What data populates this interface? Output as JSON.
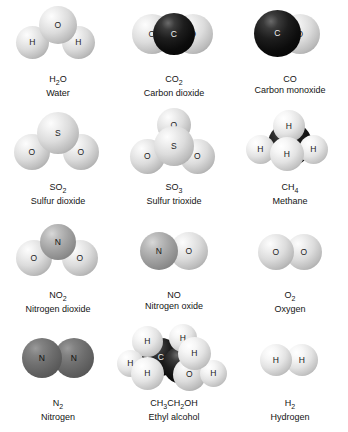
{
  "figure": {
    "kind": "molecular-model-grid",
    "columns": 3,
    "rows": 4,
    "palette": {
      "hydrogen": "#f2f2f2",
      "oxygen": "#dcdcdc",
      "sulfur": "#e0e0e0",
      "nitrogen": "#8b8b8b",
      "carbon": "#0c0c0c",
      "background": "#ffffff",
      "label_text": "#141414"
    }
  },
  "molecules": [
    {
      "id": "water",
      "formula_html": "H<sub>2</sub>O",
      "formula_plain": "H2O",
      "name": "Water",
      "atoms": [
        {
          "symbol": "O",
          "shade": "s-light",
          "size": 38,
          "x": 39,
          "y": 6,
          "z": 2
        },
        {
          "symbol": "H",
          "shade": "s-light",
          "size": 33,
          "x": 16,
          "y": 26,
          "z": 1
        },
        {
          "symbol": "H",
          "shade": "s-light",
          "size": 33,
          "x": 62,
          "y": 26,
          "z": 1
        }
      ]
    },
    {
      "id": "carbon-dioxide",
      "formula_html": "CO<sub>2</sub>",
      "formula_plain": "CO2",
      "name": "Carbon dioxide",
      "atoms": [
        {
          "symbol": "O",
          "shade": "s-light",
          "size": 40,
          "x": 16,
          "y": 14,
          "z": 1
        },
        {
          "symbol": "O",
          "shade": "s-light",
          "size": 40,
          "x": 57,
          "y": 14,
          "z": 1
        },
        {
          "symbol": "C",
          "shade": "s-black",
          "size": 42,
          "x": 37,
          "y": 13,
          "z": 3
        }
      ]
    },
    {
      "id": "carbon-monoxide",
      "formula_html": "CO",
      "formula_plain": "CO",
      "name": "Carbon monoxide",
      "atoms": [
        {
          "symbol": "O",
          "shade": "s-light",
          "size": 40,
          "x": 48,
          "y": 14,
          "z": 1
        },
        {
          "symbol": "C",
          "shade": "s-black",
          "size": 47,
          "x": 22,
          "y": 10,
          "z": 3
        }
      ]
    },
    {
      "id": "sulfur-dioxide",
      "formula_html": "SO<sub>2</sub>",
      "formula_plain": "SO2",
      "name": "Sulfur dioxide",
      "atoms": [
        {
          "symbol": "S",
          "shade": "s-light",
          "size": 42,
          "x": 37,
          "y": 4,
          "z": 2
        },
        {
          "symbol": "O",
          "shade": "s-light",
          "size": 36,
          "x": 14,
          "y": 26,
          "z": 1
        },
        {
          "symbol": "O",
          "shade": "s-light",
          "size": 36,
          "x": 63,
          "y": 26,
          "z": 1
        }
      ]
    },
    {
      "id": "sulfur-trioxide",
      "formula_html": "SO<sub>3</sub>",
      "formula_plain": "SO3",
      "name": "Sulfur trioxide",
      "atoms": [
        {
          "symbol": "O",
          "shade": "s-light",
          "size": 34,
          "x": 41,
          "y": 0,
          "z": 1
        },
        {
          "symbol": "S",
          "shade": "s-light",
          "size": 40,
          "x": 38,
          "y": 18,
          "z": 3
        },
        {
          "symbol": "O",
          "shade": "s-light",
          "size": 35,
          "x": 14,
          "y": 31,
          "z": 2
        },
        {
          "symbol": "O",
          "shade": "s-light",
          "size": 35,
          "x": 64,
          "y": 31,
          "z": 2
        }
      ]
    },
    {
      "id": "methane",
      "formula_html": "CH<sub>4</sub>",
      "formula_plain": "CH4",
      "name": "Methane",
      "atoms": [
        {
          "symbol": "C",
          "shade": "s-black",
          "size": 44,
          "x": 36,
          "y": 14,
          "z": 1
        },
        {
          "symbol": "H",
          "shade": "s-white",
          "size": 32,
          "x": 41,
          "y": 2,
          "z": 2
        },
        {
          "symbol": "H",
          "shade": "s-white",
          "size": 29,
          "x": 14,
          "y": 27,
          "z": 2
        },
        {
          "symbol": "H",
          "shade": "s-white",
          "size": 29,
          "x": 67,
          "y": 27,
          "z": 2
        },
        {
          "symbol": "H",
          "shade": "s-white",
          "size": 34,
          "x": 38,
          "y": 29,
          "z": 3
        }
      ]
    },
    {
      "id": "nitrogen-dioxide",
      "formula_html": "NO<sub>2</sub>",
      "formula_plain": "NO2",
      "name": "Nitrogen dioxide",
      "atoms": [
        {
          "symbol": "N",
          "shade": "s-mid",
          "size": 36,
          "x": 40,
          "y": 8,
          "z": 2
        },
        {
          "symbol": "O",
          "shade": "s-light",
          "size": 36,
          "x": 16,
          "y": 24,
          "z": 1
        },
        {
          "symbol": "O",
          "shade": "s-light",
          "size": 36,
          "x": 62,
          "y": 24,
          "z": 1
        }
      ]
    },
    {
      "id": "nitrogen-oxide",
      "formula_html": "NO",
      "formula_plain": "NO",
      "name": "Nitrogen oxide",
      "atoms": [
        {
          "symbol": "N",
          "shade": "s-mid",
          "size": 38,
          "x": 24,
          "y": 16,
          "z": 2
        },
        {
          "symbol": "O",
          "shade": "s-light",
          "size": 38,
          "x": 54,
          "y": 16,
          "z": 1
        }
      ]
    },
    {
      "id": "oxygen",
      "formula_html": "O<sub>2</sub>",
      "formula_plain": "O2",
      "name": "Oxygen",
      "atoms": [
        {
          "symbol": "O",
          "shade": "s-light",
          "size": 36,
          "x": 26,
          "y": 18,
          "z": 2
        },
        {
          "symbol": "O",
          "shade": "s-light",
          "size": 36,
          "x": 54,
          "y": 18,
          "z": 1
        }
      ]
    },
    {
      "id": "nitrogen",
      "formula_html": "N<sub>2</sub>",
      "formula_plain": "N2",
      "name": "Nitrogen",
      "atoms": [
        {
          "symbol": "N",
          "shade": "s-dark",
          "size": 40,
          "x": 22,
          "y": 14,
          "z": 2
        },
        {
          "symbol": "N",
          "shade": "s-dark",
          "size": 40,
          "x": 54,
          "y": 14,
          "z": 1
        }
      ]
    },
    {
      "id": "ethyl-alcohol",
      "formula_html": "CH<sub>3</sub>CH<sub>2</sub>OH",
      "formula_plain": "CH3CH2OH",
      "name": "Ethyl alcohol",
      "atoms": [
        {
          "symbol": "C",
          "shade": "s-black",
          "size": 38,
          "x": 26,
          "y": 14,
          "z": 2
        },
        {
          "symbol": "C",
          "shade": "s-black",
          "size": 38,
          "x": 47,
          "y": 22,
          "z": 2
        },
        {
          "symbol": "H",
          "shade": "s-white",
          "size": 31,
          "x": 16,
          "y": 2,
          "z": 4
        },
        {
          "symbol": "H",
          "shade": "s-white",
          "size": 27,
          "x": 1,
          "y": 26,
          "z": 4
        },
        {
          "symbol": "H",
          "shade": "s-white",
          "size": 33,
          "x": 15,
          "y": 33,
          "z": 5
        },
        {
          "symbol": "H",
          "shade": "s-white",
          "size": 28,
          "x": 53,
          "y": 0,
          "z": 4
        },
        {
          "symbol": "H",
          "shade": "s-white",
          "size": 33,
          "x": 62,
          "y": 13,
          "z": 4
        },
        {
          "symbol": "O",
          "shade": "s-light",
          "size": 33,
          "x": 57,
          "y": 34,
          "z": 3
        },
        {
          "symbol": "H",
          "shade": "s-white",
          "size": 27,
          "x": 84,
          "y": 36,
          "z": 3
        }
      ]
    },
    {
      "id": "hydrogen",
      "formula_html": "H<sub>2</sub>",
      "formula_plain": "H2",
      "name": "Hydrogen",
      "atoms": [
        {
          "symbol": "H",
          "shade": "s-white",
          "size": 32,
          "x": 28,
          "y": 20,
          "z": 2
        },
        {
          "symbol": "H",
          "shade": "s-white",
          "size": 32,
          "x": 54,
          "y": 20,
          "z": 1
        }
      ]
    }
  ]
}
